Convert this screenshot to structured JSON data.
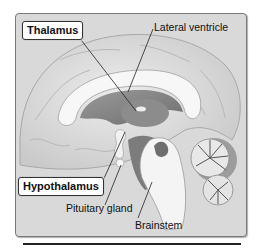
{
  "figure": {
    "labels": {
      "thalamus": "Thalamus",
      "lateral_ventricle": "Lateral ventricle",
      "hypothalamus": "Hypothalamus",
      "pituitary_gland": "Pituitary gland",
      "brainstem": "Brainstem"
    },
    "boxed_labels": [
      "Thalamus",
      "Hypothalamus"
    ],
    "colors": {
      "background": "#d9d9d9",
      "frame_border": "#7a7a7a",
      "label_box": "#ffffff",
      "leader_line": "#222222"
    }
  }
}
